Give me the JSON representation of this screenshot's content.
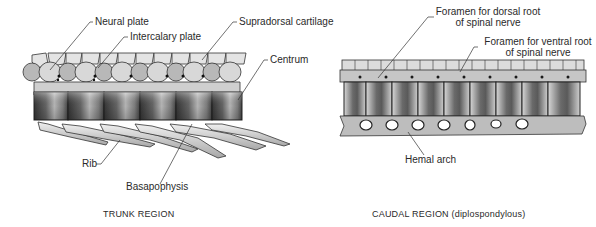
{
  "figure": {
    "panels": [
      {
        "id": "trunk",
        "caption": "TRUNK REGION",
        "labels": {
          "neural_plate": "Neural plate",
          "intercalary_plate": "Intercalary plate",
          "supradorsal_cartilage": "Supradorsal cartilage",
          "centrum": "Centrum",
          "rib": "Rib",
          "basapophysis": "Basapophysis"
        }
      },
      {
        "id": "caudal",
        "caption": "CAUDAL REGION (diplospondylous)",
        "labels": {
          "foramen_dorsal_line1": "Foramen for dorsal root",
          "foramen_dorsal_line2": "of spinal nerve",
          "foramen_ventral_line1": "Foramen for ventral root",
          "foramen_ventral_line2": "of spinal nerve",
          "hemal_arch": "Hemal arch"
        }
      }
    ],
    "colors": {
      "background": "#ffffff",
      "ink": "#2a2a2a",
      "bone_light": "#e6e6e6",
      "bone_mid": "#9a9a9a",
      "bone_dark": "#3c3c3c"
    }
  }
}
